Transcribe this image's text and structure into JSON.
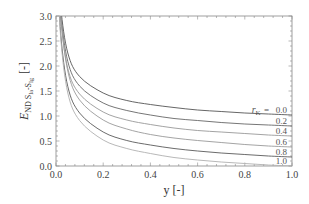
{
  "chart_data": {
    "type": "line",
    "title": "",
    "xlabel": "y [-]",
    "ylabel": {
      "main": "E",
      "sub_part1": "ND S",
      "subsub_part1": "Ia",
      "sub_part2": "-S",
      "subsub_part2": "Ig",
      "unit": "[-]"
    },
    "xlim": [
      0.0,
      1.0
    ],
    "ylim": [
      0.0,
      3.0
    ],
    "x_ticks": [
      "0.0",
      "0.2",
      "0.4",
      "0.6",
      "0.8",
      "1.0"
    ],
    "y_ticks": [
      "0.0",
      "0.5",
      "1.0",
      "1.5",
      "2.0",
      "2.5",
      "3.0"
    ],
    "grid": false,
    "legend_position": "right-inside",
    "legend_param_symbol": "r",
    "legend_param_sub": "K",
    "legend_param_eq": "=",
    "x": [
      0.01,
      0.02,
      0.05,
      0.1,
      0.2,
      0.3,
      0.4,
      0.5,
      0.6,
      0.7,
      0.8,
      0.9,
      1.0
    ],
    "series": [
      {
        "name": "0.0",
        "color": "#555555",
        "values": [
          4.22,
          3.18,
          2.26,
          1.79,
          1.46,
          1.31,
          1.23,
          1.17,
          1.12,
          1.09,
          1.06,
          1.04,
          1.02
        ]
      },
      {
        "name": "0.2",
        "color": "#666666",
        "values": [
          4.15,
          3.06,
          2.09,
          1.6,
          1.26,
          1.11,
          1.02,
          0.95,
          0.91,
          0.87,
          0.84,
          0.82,
          0.8
        ]
      },
      {
        "name": "0.4",
        "color": "#999999",
        "values": [
          4.09,
          2.96,
          1.95,
          1.44,
          1.08,
          0.92,
          0.83,
          0.76,
          0.71,
          0.68,
          0.65,
          0.62,
          0.6
        ]
      },
      {
        "name": "0.6",
        "color": "#9a9a9a",
        "values": [
          4.31,
          3.03,
          1.9,
          1.32,
          0.92,
          0.74,
          0.63,
          0.56,
          0.51,
          0.47,
          0.43,
          0.4,
          0.38
        ]
      },
      {
        "name": "0.8",
        "color": "#5a5a5a",
        "values": [
          3.83,
          2.64,
          1.59,
          1.06,
          0.68,
          0.51,
          0.42,
          0.35,
          0.3,
          0.26,
          0.23,
          0.2,
          0.18
        ]
      },
      {
        "name": "1.0",
        "color": "#b0b0b0",
        "values": [
          3.79,
          2.56,
          1.46,
          0.91,
          0.52,
          0.35,
          0.25,
          0.17,
          0.12,
          0.08,
          0.05,
          0.02,
          0.0
        ]
      }
    ]
  }
}
